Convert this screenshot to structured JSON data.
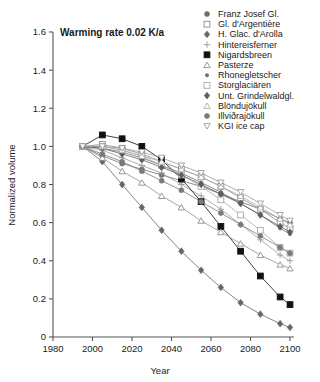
{
  "chart_data": {
    "type": "line",
    "title": "Warming rate 0.02 K/a",
    "xlabel": "Year",
    "ylabel": "Normalized volume",
    "xlim": [
      1980,
      2100
    ],
    "ylim": [
      0,
      1.6
    ],
    "xticks": [
      1980,
      2000,
      2020,
      2040,
      2060,
      2080,
      2100
    ],
    "yticks": [
      "0",
      "0.2",
      "0.4",
      "0.6",
      "0.8",
      "1.0",
      "1.2",
      "1.4",
      "1.6"
    ],
    "ytick_values": [
      0,
      0.2,
      0.4,
      0.6,
      0.8,
      1.0,
      1.2,
      1.4,
      1.6
    ],
    "grid": false,
    "legend_position": "top-right",
    "x": [
      1995,
      2005,
      2015,
      2025,
      2035,
      2045,
      2055,
      2065,
      2075,
      2085,
      2095,
      2100
    ],
    "series": [
      {
        "name": "Franz Josef Gl.",
        "marker": "filled-circle",
        "color": "#6e6e6e",
        "values": [
          1.0,
          0.95,
          0.91,
          0.88,
          0.85,
          0.82,
          0.79,
          0.75,
          0.71,
          0.67,
          0.62,
          0.6
        ]
      },
      {
        "name": "Gl. d'Argentière",
        "marker": "open-square",
        "color": "#8c8c8c",
        "values": [
          1.0,
          1.01,
          0.99,
          0.96,
          0.92,
          0.88,
          0.84,
          0.79,
          0.73,
          0.67,
          0.6,
          0.57
        ]
      },
      {
        "name": "H. Glac. d'Arolla",
        "marker": "filled-diamond",
        "color": "#666666",
        "values": [
          1.0,
          0.92,
          0.8,
          0.68,
          0.56,
          0.45,
          0.35,
          0.26,
          0.18,
          0.12,
          0.07,
          0.05
        ]
      },
      {
        "name": "Hintereisferner",
        "marker": "plus",
        "color": "#9a9a9a",
        "values": [
          1.0,
          0.98,
          0.94,
          0.9,
          0.86,
          0.8,
          0.74,
          0.67,
          0.59,
          0.51,
          0.43,
          0.4
        ]
      },
      {
        "name": "Nigardsbreen",
        "marker": "filled-square",
        "color": "#111111",
        "values": [
          1.0,
          1.06,
          1.04,
          1.0,
          0.93,
          0.83,
          0.71,
          0.58,
          0.45,
          0.32,
          0.21,
          0.17
        ]
      },
      {
        "name": "Pasterze",
        "marker": "open-triangle-up",
        "color": "#8f8f8f",
        "values": [
          1.0,
          0.94,
          0.87,
          0.81,
          0.74,
          0.68,
          0.61,
          0.55,
          0.49,
          0.43,
          0.38,
          0.36
        ]
      },
      {
        "name": "Rhonegletscher",
        "marker": "filled-circle-small",
        "color": "#707070",
        "values": [
          1.0,
          0.99,
          0.97,
          0.94,
          0.9,
          0.86,
          0.81,
          0.76,
          0.7,
          0.64,
          0.57,
          0.54
        ]
      },
      {
        "name": "Storglaciären",
        "marker": "open-square-light",
        "color": "#a8a8a8",
        "values": [
          1.0,
          1.0,
          0.98,
          0.95,
          0.9,
          0.85,
          0.79,
          0.72,
          0.64,
          0.56,
          0.47,
          0.44
        ]
      },
      {
        "name": "Unt. Grindelwaldgl.",
        "marker": "filled-diamond-mid",
        "color": "#5e5e5e",
        "values": [
          1.0,
          0.99,
          0.96,
          0.93,
          0.89,
          0.85,
          0.8,
          0.75,
          0.7,
          0.64,
          0.58,
          0.55
        ]
      },
      {
        "name": "Blöndujökull",
        "marker": "open-triangle-light",
        "color": "#b0b0b0",
        "values": [
          1.0,
          1.0,
          0.98,
          0.95,
          0.92,
          0.88,
          0.84,
          0.79,
          0.74,
          0.68,
          0.62,
          0.59
        ]
      },
      {
        "name": "Illviðrajökull",
        "marker": "filled-circle-grey",
        "color": "#7a7a7a",
        "values": [
          1.0,
          0.96,
          0.92,
          0.87,
          0.82,
          0.77,
          0.71,
          0.65,
          0.59,
          0.53,
          0.47,
          0.44
        ]
      },
      {
        "name": "KGI ice cap",
        "marker": "open-triangle-down",
        "color": "#9c9c9c",
        "values": [
          1.0,
          1.0,
          0.99,
          0.97,
          0.94,
          0.9,
          0.86,
          0.81,
          0.76,
          0.7,
          0.64,
          0.61
        ]
      }
    ]
  }
}
